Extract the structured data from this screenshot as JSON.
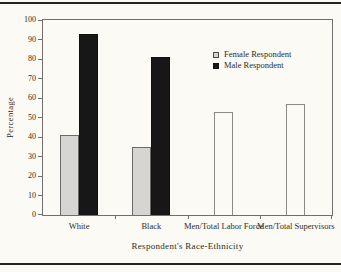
{
  "colors": {
    "background": "#fbfaf4",
    "text": "#2f2d26",
    "axis": "#6f6f6f",
    "rule": "#25241f",
    "female_fill": "#d6d5d1",
    "male_fill": "#171717",
    "open_fill": "#fbfaf4"
  },
  "legend": {
    "items": [
      {
        "label": "Female Respondent",
        "swatch": "female"
      },
      {
        "label": "Male Respondent",
        "swatch": "male"
      }
    ]
  },
  "chart_data": {
    "type": "bar",
    "title": "",
    "xlabel": "Respondent's Race-Ethnicity",
    "ylabel": "Percentage",
    "categories": [
      "White",
      "Black",
      "Men/Total Labor Force",
      "Men/Total Supervisors"
    ],
    "series": [
      {
        "name": "Female Respondent",
        "style": "female",
        "values": [
          41,
          35,
          null,
          null
        ]
      },
      {
        "name": "Male Respondent",
        "style": "male",
        "values": [
          93,
          81,
          null,
          null
        ]
      },
      {
        "name": "Men/Total (open bars)",
        "style": "open",
        "values": [
          null,
          null,
          53,
          57
        ]
      }
    ],
    "ylim": [
      0,
      100
    ],
    "yticks": [
      0,
      10,
      20,
      30,
      40,
      50,
      60,
      70,
      80,
      90,
      100
    ],
    "grid": false,
    "legend": [
      "Female Respondent",
      "Male Respondent"
    ],
    "legend_position": "inside upper right"
  }
}
